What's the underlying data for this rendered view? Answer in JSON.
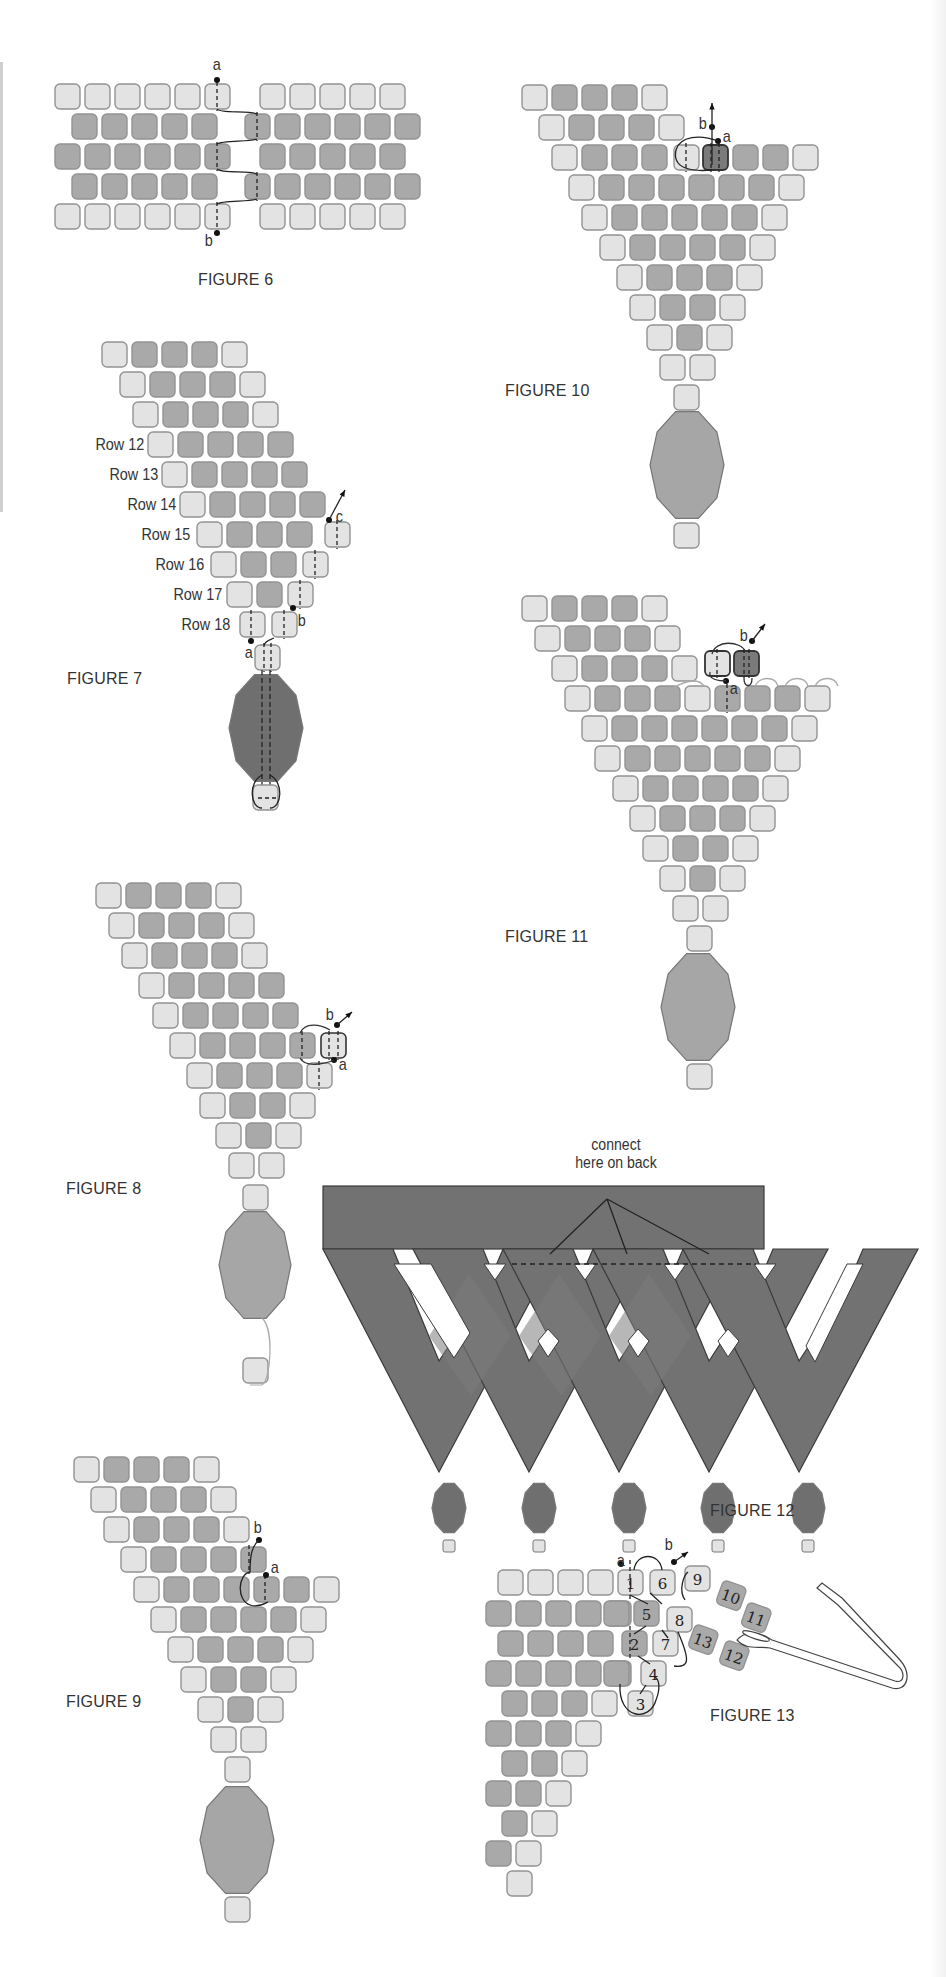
{
  "colors": {
    "bead_light": "#e3e3e3",
    "bead_dark": "#a9a9a9",
    "bead_accent": "#7a7a7a",
    "bead_border": "#939393",
    "drop_bead": "#a6a6a6",
    "drop_bead_dark": "#6f6f6f",
    "triangle_fill": "#727272",
    "thread": "#222222"
  },
  "figures": {
    "fig6": {
      "label": "FIGURE 6",
      "annotations": [
        "a",
        "b"
      ]
    },
    "fig7": {
      "label": "FIGURE 7",
      "annotations": [
        "a",
        "b",
        "c"
      ],
      "row_labels": [
        "Row 12",
        "Row 13",
        "Row 14",
        "Row 15",
        "Row 16",
        "Row 17",
        "Row 18"
      ]
    },
    "fig8": {
      "label": "FIGURE 8",
      "annotations": [
        "a",
        "b"
      ]
    },
    "fig9": {
      "label": "FIGURE 9",
      "annotations": [
        "a",
        "b"
      ]
    },
    "fig10": {
      "label": "FIGURE 10",
      "annotations": [
        "a",
        "b"
      ]
    },
    "fig11": {
      "label": "FIGURE 11",
      "annotations": [
        "a",
        "b"
      ]
    },
    "fig12": {
      "label": "FIGURE 12",
      "callout_line1": "connect",
      "callout_line2": "here on back"
    },
    "fig13": {
      "label": "FIGURE 13",
      "annotations": [
        "a",
        "b"
      ],
      "bead_numbers": [
        "1",
        "2",
        "3",
        "4",
        "5",
        "6",
        "7",
        "8",
        "9",
        "10",
        "11",
        "12",
        "13"
      ]
    }
  }
}
